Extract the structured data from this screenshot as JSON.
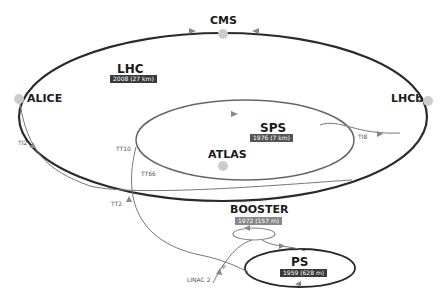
{
  "rings": {
    "lhc": {
      "name": "LHC",
      "year_size": "2008 (27 km)",
      "badge_color": "#3a3a3a"
    },
    "sps": {
      "name": "SPS",
      "year_size": "1976 (7 km)",
      "badge_color": "#555555"
    },
    "booster": {
      "name": "BOOSTER",
      "year_size": "1972 (157 m)",
      "badge_color": "#888888"
    },
    "ps": {
      "name": "PS",
      "year_size": "1959 (628 m)",
      "badge_color": "#3a3a3a"
    }
  },
  "experiments": {
    "cms": "CMS",
    "alice": "ALICE",
    "lhcb": "LHCb",
    "atlas": "ATLAS"
  },
  "transfer_lines": {
    "ti2": "TI2",
    "ti8": "TI8",
    "tt10": "TT10",
    "tt66": "TT66",
    "tt2": "TT2",
    "linac2": "LINAC 2",
    "p": "p"
  }
}
